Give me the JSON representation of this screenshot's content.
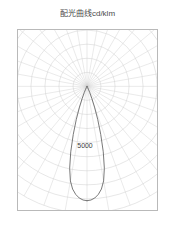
{
  "chart_title": "配光曲线cd/klm",
  "chart_data": {
    "type": "line",
    "plot_style": "polar",
    "title": "配光曲线cd/klm",
    "subtitle": "",
    "xlabel": "",
    "ylabel": "",
    "unit": "cd/klm",
    "annotations": [
      {
        "text": "5000",
        "value": 5000,
        "x_px": 85,
        "y_px": 148
      }
    ],
    "tick_labels": [
      "5000"
    ],
    "legend": [],
    "legend_position": "none",
    "grid": true,
    "grid_type": "polar",
    "angle_origin_deg": 0,
    "angle_direction": "downward-nadir",
    "angle_step_deg": 10,
    "angle_min_deg": -90,
    "angle_max_deg": 90,
    "radial_rings": 9,
    "rlim": [
      0,
      6200
    ],
    "ring_step": 700,
    "center_px": {
      "x": 70,
      "y": 57
    },
    "series": [
      {
        "name": "C0-C180",
        "angles_deg": [
          0,
          2,
          4,
          6,
          8,
          10,
          12,
          14,
          16,
          18,
          20,
          22,
          24,
          26,
          28,
          30
        ],
        "values": [
          5600,
          5570,
          5480,
          5320,
          5080,
          4700,
          4100,
          3300,
          2450,
          1700,
          1080,
          640,
          340,
          160,
          60,
          0
        ]
      },
      {
        "name": "C90-C270",
        "angles_deg": [
          0,
          2,
          4,
          6,
          8,
          10,
          12,
          14,
          16,
          18,
          20,
          22,
          24,
          26,
          28,
          30
        ],
        "values": [
          5600,
          5570,
          5480,
          5320,
          5080,
          4700,
          4100,
          3300,
          2450,
          1700,
          1080,
          640,
          340,
          160,
          60,
          0
        ]
      }
    ]
  },
  "colors": {
    "grid": "#cfcfcf",
    "frame": "#b9b9b9",
    "curve": "#555555",
    "title_text": "#4a4a4a",
    "label_text": "#3d3d3d",
    "background": "#ffffff"
  }
}
